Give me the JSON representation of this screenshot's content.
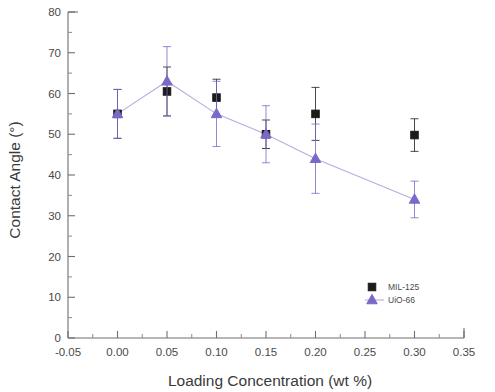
{
  "chart_data": {
    "type": "scatter",
    "title": "",
    "xlabel": "Loading Concentration (wt %)",
    "ylabel": "Contact Angle (°)",
    "xlim": [
      -0.05,
      0.35
    ],
    "ylim": [
      0,
      80
    ],
    "xticks": [
      -0.05,
      0.0,
      0.05,
      0.1,
      0.15,
      0.2,
      0.25,
      0.3,
      0.35
    ],
    "xticklabels": [
      "-0.05",
      "0.00",
      "0.05",
      "0.10",
      "0.15",
      "0.20",
      "0.25",
      "0.30",
      "0.35"
    ],
    "yticks": [
      0,
      10,
      20,
      30,
      40,
      50,
      60,
      70,
      80
    ],
    "yticklabels": [
      "0",
      "10",
      "20",
      "30",
      "40",
      "50",
      "60",
      "70",
      "80"
    ],
    "x_minor_tick_step": 0.025,
    "y_minor_tick_step": 5,
    "grid": false,
    "legend_position": "bottom-right",
    "series": [
      {
        "name": "MIL-125",
        "marker": "square",
        "color": "#1f1a1a",
        "connected": false,
        "x": [
          0.0,
          0.05,
          0.1,
          0.15,
          0.2,
          0.3
        ],
        "values": [
          55.0,
          60.5,
          59.0,
          50.0,
          55.0,
          49.8
        ],
        "errors": [
          6.0,
          6.0,
          4.5,
          3.5,
          6.5,
          4.0
        ]
      },
      {
        "name": "UiO-66",
        "marker": "triangle",
        "color": "#7b68c8",
        "connected": true,
        "x": [
          0.0,
          0.05,
          0.1,
          0.15,
          0.2,
          0.3
        ],
        "values": [
          55.0,
          63.0,
          55.0,
          50.0,
          44.0,
          34.0
        ],
        "errors": [
          6.0,
          8.5,
          8.0,
          7.0,
          8.5,
          4.5
        ]
      }
    ]
  },
  "legend": {
    "items": [
      {
        "label": "MIL-125",
        "marker": "square",
        "color": "#1f1a1a"
      },
      {
        "label": "UiO-66",
        "marker": "triangle",
        "color": "#7b68c8"
      }
    ]
  },
  "colors": {
    "axis": "#6e6e6e",
    "text": "#3a3a3a",
    "series_mil125": "#1f1a1a",
    "series_uio66": "#7b68c8",
    "background": "#ffffff"
  }
}
